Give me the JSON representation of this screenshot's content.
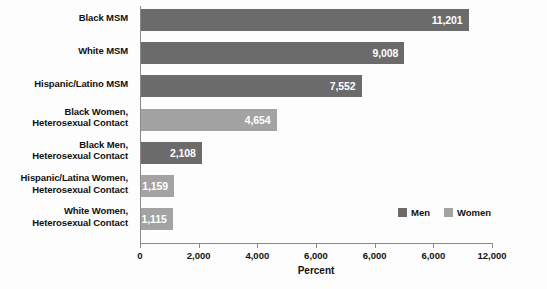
{
  "chart_data": {
    "type": "bar",
    "orientation": "horizontal",
    "title": "",
    "xlabel": "Percent",
    "ylabel": "",
    "xlim": [
      0,
      12000
    ],
    "grid": false,
    "legend_position": "inside-bottom-right",
    "categories": [
      "Black MSM",
      "White MSM",
      "Hispanic/Latino MSM",
      "Black Women, Heterosexual Contact",
      "Black Men, Heterosexual Contact",
      "Hispanic/Latina Women, Heterosexual Contact",
      "White Women, Heterosexual Contact"
    ],
    "category_lines": [
      [
        "Black MSM",
        ""
      ],
      [
        "White MSM",
        ""
      ],
      [
        "Hispanic/Latino MSM",
        ""
      ],
      [
        "Black Women,",
        "Heterosexual Contact"
      ],
      [
        "Black Men,",
        "Heterosexual Contact"
      ],
      [
        "Hispanic/Latina Women,",
        "Heterosexual Contact"
      ],
      [
        "White Women,",
        "Heterosexual Contact"
      ]
    ],
    "values": [
      11201,
      9008,
      7552,
      4654,
      2108,
      1159,
      1115
    ],
    "value_labels": [
      "11,201",
      "9,008",
      "7,552",
      "4,654",
      "2,108",
      "1,159",
      "1,115"
    ],
    "group": [
      "Men",
      "Men",
      "Men",
      "Women",
      "Men",
      "Women",
      "Women"
    ],
    "tick_values": [
      0,
      2000,
      4000,
      6000,
      8000,
      10000,
      12000
    ],
    "tick_labels": [
      "0",
      "2,000",
      "4,000",
      "6,000",
      "6,000",
      "6,000",
      "12,000"
    ],
    "series": [
      {
        "name": "Men",
        "color": "#6b6b6b"
      },
      {
        "name": "Women",
        "color": "#a3a3a3"
      }
    ]
  },
  "legend": {
    "items": [
      {
        "label": "Men",
        "color": "#6b6b6b"
      },
      {
        "label": "Women",
        "color": "#a3a3a3"
      }
    ]
  },
  "colors": {
    "men": "#6b6b6b",
    "women": "#a3a3a3",
    "axis": "#8a8a8a",
    "text": "#111111",
    "value_text": "#ffffff",
    "background": "#fdfdfd"
  }
}
